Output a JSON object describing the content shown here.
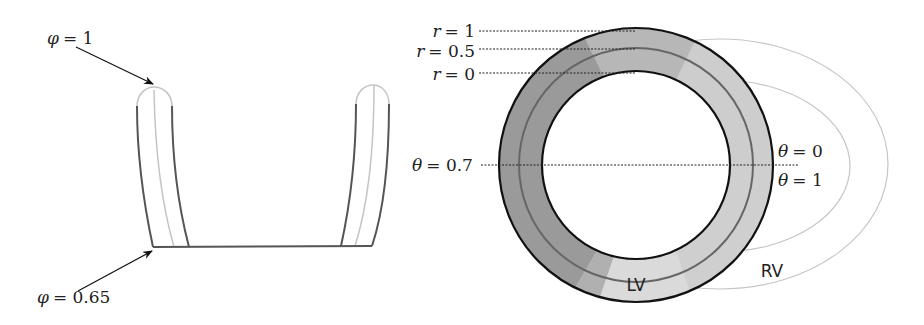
{
  "left_diagram": {
    "name": "longitudinal-coordinate-profile",
    "labels": {
      "top_var": "φ",
      "top_eq": "= 1",
      "bottom_var": "φ",
      "bottom_eq": "= 0.65"
    }
  },
  "right_diagram": {
    "name": "transmural-circumferential-coordinates",
    "radial_labels": [
      {
        "var": "r",
        "eq": "= 1"
      },
      {
        "var": "r",
        "eq": "= 0.5"
      },
      {
        "var": "r",
        "eq": "= 0"
      }
    ],
    "angle_labels": {
      "left": {
        "var": "θ",
        "eq": "= 0.7"
      },
      "right_top": {
        "var": "θ",
        "eq": "= 0"
      },
      "right_bottom": {
        "var": "θ",
        "eq": "= 1"
      }
    },
    "chamber_labels": {
      "lv": "LV",
      "rv": "RV"
    },
    "colors": {
      "ring_dark": "#8f8f8f",
      "ring_light": "#c8c8c8",
      "ring_lighter": "#d6d6d6",
      "outline": "#111111",
      "mid_line": "#666666",
      "rv_line": "#bdbdbd",
      "rv_text": "#bdbdbd"
    }
  }
}
